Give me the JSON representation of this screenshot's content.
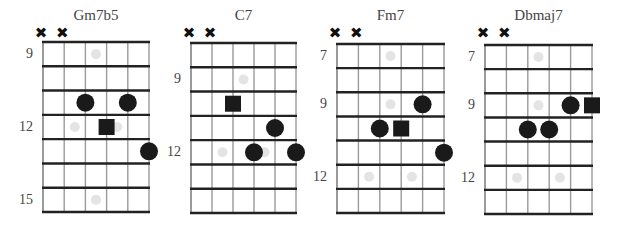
{
  "chords": [
    {
      "name": "Gm7b5",
      "muted_strings": [
        1,
        2
      ],
      "mute_symbol": "✖",
      "fret_labels": [
        {
          "label": "9",
          "space": 1
        },
        {
          "label": "12",
          "space": 4
        },
        {
          "label": "15",
          "space": 7
        }
      ],
      "grid": {
        "x0": 43,
        "x1": 149,
        "y0": 42,
        "y1": 212,
        "strings": 6,
        "spaces": 7
      },
      "notes": [
        {
          "string": 3,
          "space": 3,
          "shape": "circle"
        },
        {
          "string": 5,
          "space": 3,
          "shape": "circle"
        },
        {
          "string": 4,
          "space": 4,
          "shape": "square"
        },
        {
          "string": 6,
          "space": 5,
          "shape": "circle"
        }
      ],
      "inlays": [
        {
          "between": 3.5,
          "space": 1
        },
        {
          "between": 2.5,
          "space": 4
        },
        {
          "between": 4.5,
          "space": 4
        },
        {
          "between": 3.5,
          "space": 7
        }
      ]
    },
    {
      "name": "C7",
      "muted_strings": [
        1,
        2
      ],
      "mute_symbol": "✖",
      "fret_labels": [
        {
          "label": "9",
          "space": 2
        },
        {
          "label": "12",
          "space": 5
        }
      ],
      "grid": {
        "x0": 191,
        "x1": 296,
        "y0": 43,
        "y1": 213,
        "strings": 6,
        "spaces": 7
      },
      "notes": [
        {
          "string": 3,
          "space": 3,
          "shape": "square"
        },
        {
          "string": 5,
          "space": 4,
          "shape": "circle"
        },
        {
          "string": 4,
          "space": 5,
          "shape": "circle"
        },
        {
          "string": 6,
          "space": 5,
          "shape": "circle"
        }
      ],
      "inlays": [
        {
          "between": 3.5,
          "space": 2
        },
        {
          "between": 2.5,
          "space": 5
        },
        {
          "between": 4.5,
          "space": 5
        }
      ]
    },
    {
      "name": "Fm7",
      "muted_strings": [
        1,
        2
      ],
      "mute_symbol": "✖",
      "fret_labels": [
        {
          "label": "7",
          "space": 1
        },
        {
          "label": "9",
          "space": 3
        },
        {
          "label": "12",
          "space": 6
        }
      ],
      "grid": {
        "x0": 337,
        "x1": 444,
        "y0": 44,
        "y1": 213,
        "strings": 6,
        "spaces": 7
      },
      "notes": [
        {
          "string": 5,
          "space": 3,
          "shape": "circle"
        },
        {
          "string": 3,
          "space": 4,
          "shape": "circle"
        },
        {
          "string": 4,
          "space": 4,
          "shape": "square"
        },
        {
          "string": 6,
          "space": 5,
          "shape": "circle"
        }
      ],
      "inlays": [
        {
          "between": 3.5,
          "space": 1
        },
        {
          "between": 3.5,
          "space": 3
        },
        {
          "between": 2.5,
          "space": 6
        },
        {
          "between": 4.5,
          "space": 6
        }
      ]
    },
    {
      "name": "Dbmaj7",
      "muted_strings": [
        1,
        2
      ],
      "mute_symbol": "✖",
      "fret_labels": [
        {
          "label": "7",
          "space": 1
        },
        {
          "label": "9",
          "space": 3
        },
        {
          "label": "12",
          "space": 6
        }
      ],
      "grid": {
        "x0": 485,
        "x1": 592,
        "y0": 45,
        "y1": 214,
        "strings": 6,
        "spaces": 7
      },
      "notes": [
        {
          "string": 5,
          "space": 3,
          "shape": "circle"
        },
        {
          "string": 6,
          "space": 3,
          "shape": "square"
        },
        {
          "string": 3,
          "space": 4,
          "shape": "circle"
        },
        {
          "string": 4,
          "space": 4,
          "shape": "circle"
        }
      ],
      "inlays": [
        {
          "between": 3.5,
          "space": 1
        },
        {
          "between": 3.5,
          "space": 3
        },
        {
          "between": 2.5,
          "space": 6
        },
        {
          "between": 4.5,
          "space": 6
        }
      ]
    }
  ],
  "colors": {
    "note": "#1a1a1a",
    "inlay": "#e4e4e4",
    "fret_line": "#222222",
    "string_line": "#9a9a9a"
  }
}
